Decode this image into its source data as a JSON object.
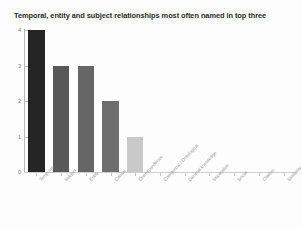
{
  "chart_data": {
    "type": "bar",
    "title": "Temporal, entity and subject relationships most often named in top three",
    "xlabel": "",
    "ylabel": "",
    "ylim": [
      0,
      4
    ],
    "yticks": [
      "0",
      "1",
      "2",
      "3",
      "4"
    ],
    "grid": false,
    "legend": "none",
    "categories": [
      "Temporal",
      "Subject",
      "Entity",
      "Causal",
      "Correspondence",
      "Categorical / Ontological",
      "General knowledge",
      "Separation",
      "Social",
      "Citation",
      "Similarity"
    ],
    "values": [
      4,
      3,
      3,
      2,
      1,
      0,
      0,
      0,
      0,
      0,
      0
    ],
    "bar_colors": [
      "#252525",
      "#585858",
      "#666666",
      "#6e6e6e",
      "#c9c9c9",
      "#ffffff",
      "#ffffff",
      "#ffffff",
      "#ffffff",
      "#ffffff",
      "#ffffff"
    ]
  },
  "style": {
    "axis_color": "#b9b9b9",
    "tick_label_color": "#8f8f8f",
    "title_color": "#2a2a2a",
    "background": "#fdfdfd"
  }
}
